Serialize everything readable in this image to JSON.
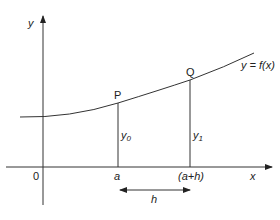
{
  "diagram": {
    "axes": {
      "y_label": "y",
      "x_label": "x",
      "origin_label": "0"
    },
    "curve": {
      "label": "y = f(x)"
    },
    "points": [
      {
        "name": "P",
        "x_label": "a",
        "ordinate_label": "y",
        "ordinate_sub": "0"
      },
      {
        "name": "Q",
        "x_label": "(a+h)",
        "ordinate_label": "y",
        "ordinate_sub": "1"
      }
    ],
    "interval": {
      "label": "h"
    },
    "colors": {
      "line": "#333333",
      "text": "#222222"
    }
  }
}
